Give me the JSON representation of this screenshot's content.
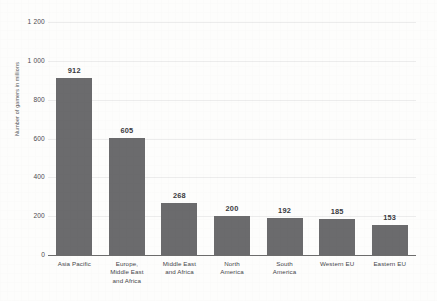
{
  "chart_data": {
    "type": "bar",
    "title": "",
    "xlabel": "",
    "ylabel": "Number of gamers in millions",
    "ylim": [
      0,
      1200
    ],
    "ytick_step": 200,
    "ytick_labels": [
      "0",
      "200",
      "400",
      "600",
      "800",
      "1 000",
      "1 200"
    ],
    "ytick_values": [
      0,
      200,
      400,
      600,
      800,
      1000,
      1200
    ],
    "grid": true,
    "legend": "none",
    "orientation": "vertical",
    "bar_color": "#6b6b6d",
    "gridline_color": "#ececec",
    "axis_color": "#6d6d6d",
    "background_color": "#fdfdfc",
    "categories": [
      "Asia Pacific",
      "Europe, Middle East and Africa",
      "Middle East and Africa",
      "North America",
      "South America",
      "Western EU",
      "Eastern EU"
    ],
    "category_label_lines": [
      [
        "Asia Pacific"
      ],
      [
        "Europe,",
        "Middle East",
        "and Africa"
      ],
      [
        "Middle East",
        "and Africa"
      ],
      [
        "North",
        "America"
      ],
      [
        "South",
        "America"
      ],
      [
        "Western EU"
      ],
      [
        "Eastern EU"
      ]
    ],
    "values": [
      912,
      605,
      268,
      200,
      192,
      185,
      153
    ],
    "value_labels": [
      "912",
      "605",
      "268",
      "200",
      "192",
      "185",
      "153"
    ]
  }
}
